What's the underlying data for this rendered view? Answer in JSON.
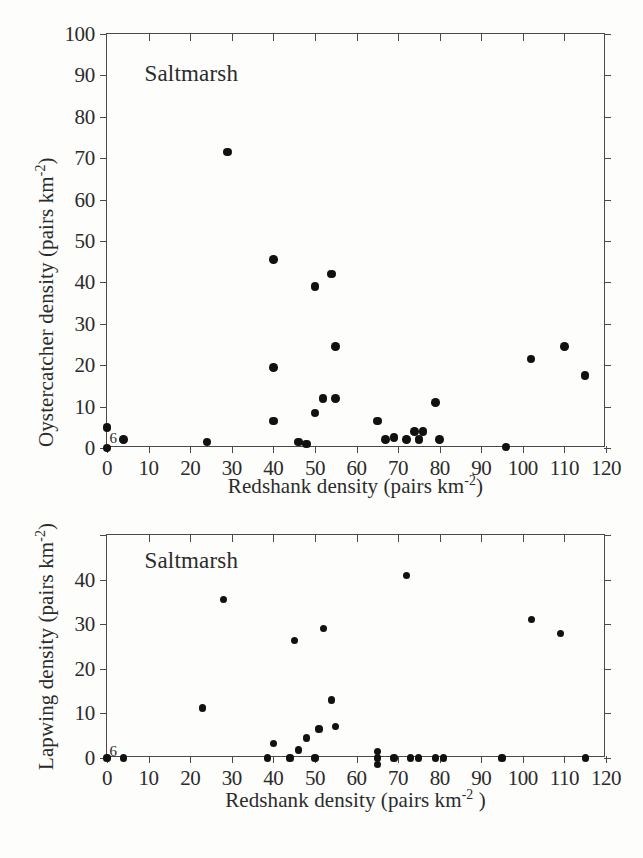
{
  "figure": {
    "background_color": "#fdfdfb",
    "marker_color": "#111111",
    "axis_color": "#4a4a4a"
  },
  "panels": [
    {
      "id": "oystercatcher",
      "habitat_label": "Saltmarsh",
      "overlap_annotation": "6",
      "chart_data": {
        "type": "scatter",
        "title": "",
        "subtitle": "Saltmarsh",
        "xlabel": "Redshank density (pairs km-2)",
        "ylabel": "Oystercatcher density (pairs km-2)",
        "xlabel_parts": {
          "text": "Redshank density (pairs km",
          "exponent": "-2",
          "tail": ")"
        },
        "ylabel_parts": {
          "text": "Oystercatcher density (pairs km",
          "exponent": "-2",
          "tail": ")"
        },
        "xlim": [
          0,
          120
        ],
        "ylim": [
          0,
          100
        ],
        "xticks": [
          0,
          10,
          20,
          30,
          40,
          50,
          60,
          70,
          80,
          90,
          100,
          110,
          120
        ],
        "xticklabels": [
          "0",
          "10",
          "20",
          "30",
          "40",
          "50",
          "60",
          "70",
          "80",
          "90",
          "100",
          "110",
          "120"
        ],
        "yticks": [
          0,
          10,
          20,
          30,
          40,
          50,
          60,
          70,
          80,
          90,
          100
        ],
        "yticklabels": [
          "0",
          "10",
          "20",
          "30",
          "40",
          "50",
          "60",
          "70",
          "80",
          "90",
          "100"
        ],
        "grid": false,
        "legend": "none",
        "annotations": [
          {
            "text": "Saltmarsh",
            "x": 9,
            "y": 90
          },
          {
            "text": "6",
            "x": 1.5,
            "y": 2.5,
            "meaning": "six coincident points at origin"
          }
        ],
        "points": [
          {
            "x": 0,
            "y": 0
          },
          {
            "x": 0,
            "y": 5
          },
          {
            "x": 4,
            "y": 2
          },
          {
            "x": 24,
            "y": 1.5
          },
          {
            "x": 29,
            "y": 71.5
          },
          {
            "x": 40,
            "y": 45.5
          },
          {
            "x": 40,
            "y": 19.5
          },
          {
            "x": 40,
            "y": 6.5
          },
          {
            "x": 46,
            "y": 1.5
          },
          {
            "x": 48,
            "y": 1
          },
          {
            "x": 50,
            "y": 39
          },
          {
            "x": 50,
            "y": 8.5
          },
          {
            "x": 52,
            "y": 12
          },
          {
            "x": 54,
            "y": 42
          },
          {
            "x": 55,
            "y": 24.5
          },
          {
            "x": 55,
            "y": 12
          },
          {
            "x": 65,
            "y": 6.5
          },
          {
            "x": 67,
            "y": 2
          },
          {
            "x": 69,
            "y": 2.5
          },
          {
            "x": 72,
            "y": 2
          },
          {
            "x": 74,
            "y": 4
          },
          {
            "x": 75,
            "y": 2
          },
          {
            "x": 76,
            "y": 4
          },
          {
            "x": 79,
            "y": 11
          },
          {
            "x": 80,
            "y": 2
          },
          {
            "x": 96,
            "y": 0.3
          },
          {
            "x": 102,
            "y": 21.5
          },
          {
            "x": 110,
            "y": 24.5
          },
          {
            "x": 115,
            "y": 17.5
          }
        ]
      }
    },
    {
      "id": "lapwing",
      "habitat_label": "Saltmarsh",
      "overlap_annotation": "6",
      "chart_data": {
        "type": "scatter",
        "title": "",
        "subtitle": "Saltmarsh",
        "xlabel": "Redshank density (pairs km-2 )",
        "ylabel": "Lapwing density (pairs km-2)",
        "xlabel_parts": {
          "text": "Redshank density (pairs km",
          "exponent": "-2",
          "tail": " )"
        },
        "ylabel_parts": {
          "text": "Lapwing density (pairs km",
          "exponent": "-2",
          "tail": ")"
        },
        "xlim": [
          0,
          120
        ],
        "ylim": [
          0,
          50
        ],
        "xticks": [
          0,
          10,
          20,
          30,
          40,
          50,
          60,
          70,
          80,
          90,
          100,
          110,
          120
        ],
        "xticklabels": [
          "0",
          "10",
          "20",
          "30",
          "40",
          "50",
          "60",
          "70",
          "80",
          "90",
          "100",
          "110",
          "120"
        ],
        "yticks": [
          0,
          10,
          20,
          30,
          40,
          50
        ],
        "yticklabels": [
          "0",
          "10",
          "20",
          "30",
          "40",
          ""
        ],
        "grid": false,
        "legend": "none",
        "annotations": [
          {
            "text": "Saltmarsh",
            "x": 9,
            "y": 44
          },
          {
            "text": "6",
            "x": 1.5,
            "y": 1.5,
            "meaning": "six coincident points at origin"
          }
        ],
        "points": [
          {
            "x": 0,
            "y": 0
          },
          {
            "x": 4,
            "y": 0
          },
          {
            "x": 23,
            "y": 11.2
          },
          {
            "x": 28,
            "y": 35.5
          },
          {
            "x": 38.5,
            "y": 0
          },
          {
            "x": 40,
            "y": 3.3
          },
          {
            "x": 44,
            "y": 0
          },
          {
            "x": 45,
            "y": 26.3
          },
          {
            "x": 46,
            "y": 1.8
          },
          {
            "x": 48,
            "y": 4.5
          },
          {
            "x": 50,
            "y": 0
          },
          {
            "x": 51,
            "y": 6.5
          },
          {
            "x": 52,
            "y": 29
          },
          {
            "x": 54,
            "y": 13
          },
          {
            "x": 55,
            "y": 7
          },
          {
            "x": 65,
            "y": 0
          },
          {
            "x": 65,
            "y": -1.5
          },
          {
            "x": 65,
            "y": 1.5
          },
          {
            "x": 69,
            "y": 0
          },
          {
            "x": 72,
            "y": 41
          },
          {
            "x": 73,
            "y": 0
          },
          {
            "x": 75,
            "y": 0
          },
          {
            "x": 79,
            "y": 0
          },
          {
            "x": 81,
            "y": 0
          },
          {
            "x": 95,
            "y": 0
          },
          {
            "x": 102,
            "y": 31
          },
          {
            "x": 109,
            "y": 28
          },
          {
            "x": 115,
            "y": 0
          }
        ]
      }
    }
  ]
}
